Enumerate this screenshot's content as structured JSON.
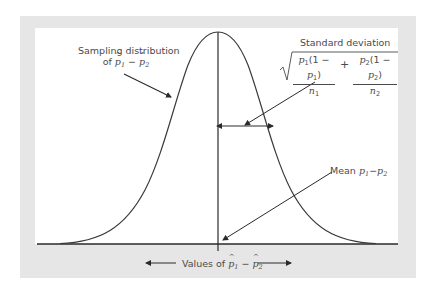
{
  "diagram": {
    "labels": {
      "sampling_line1": "Sampling distribution",
      "sampling_line2_prefix": "of ",
      "sampling_var1": "p",
      "sampling_sub1": "1",
      "sampling_minus": " − ",
      "sampling_var2": "p",
      "sampling_sub2": "2",
      "stddev_title": "Standard deviation",
      "formula": {
        "term1_num_a": "p",
        "term1_num_a_sub": "1",
        "term1_num_b": "(1 − ",
        "term1_num_c": "p",
        "term1_num_c_sub": "1",
        "term1_num_d": ")",
        "term1_den": "n",
        "term1_den_sub": "1",
        "plus": "+",
        "term2_num_a": "p",
        "term2_num_a_sub": "2",
        "term2_num_b": "(1 − ",
        "term2_num_c": "p",
        "term2_num_c_sub": "2",
        "term2_num_d": ")",
        "term2_den": "n",
        "term2_den_sub": "2"
      },
      "mean_prefix": "Mean ",
      "mean_var1": "p",
      "mean_sub1": "1",
      "mean_minus": "−",
      "mean_var2": "p",
      "mean_sub2": "2",
      "values_prefix": "Values of ",
      "values_var1": "p",
      "values_sub1": "1",
      "values_minus": " − ",
      "values_var2": "p",
      "values_sub2": "2"
    },
    "colors": {
      "frame": "#e6e6e6",
      "panel": "#ffffff",
      "curve": "#3a3a3a",
      "text": "#4a4a4a"
    }
  }
}
